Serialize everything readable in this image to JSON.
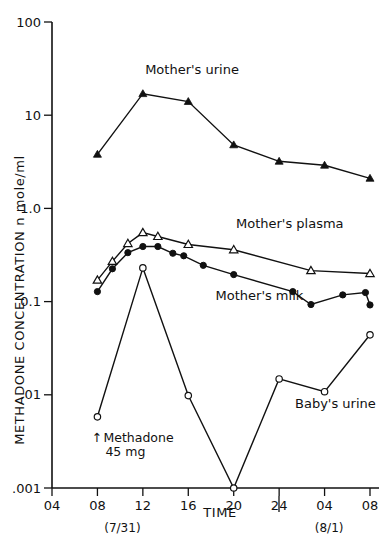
{
  "chart_data": {
    "type": "line",
    "title": "",
    "xlabel": "TIME",
    "ylabel": "METHADONE CONCENTRATION  n mole/ml",
    "y_scale": "log",
    "ylim": [
      0.001,
      100
    ],
    "y_tick_labels": [
      "100",
      "10",
      "1.0",
      "0.1",
      ".01",
      ".001"
    ],
    "y_tick_values": [
      100,
      10,
      1.0,
      0.1,
      0.01,
      0.001
    ],
    "x_tick_labels": [
      "04",
      "08",
      "12",
      "16",
      "20",
      "24",
      "04",
      "08"
    ],
    "x_positions": [
      0,
      1,
      2,
      3,
      4,
      5,
      6,
      7
    ],
    "grid": false,
    "legend_position": "inline-annotations",
    "date_markers": [
      {
        "label": "(7/31)",
        "x": 1.55
      },
      {
        "label": "(8/1)",
        "x": 6.1
      }
    ],
    "day_divider_x": 5.0,
    "annotations": [
      {
        "name": "dose-annotation",
        "line1": "Methadone",
        "line2": "45 mg",
        "arrow": "↑",
        "x": 1.0
      }
    ],
    "series": [
      {
        "name": "Mother's urine",
        "marker": "filled-triangle",
        "label_x": 2.05,
        "label_y": 28,
        "x": [
          1,
          2,
          3,
          4,
          5,
          6,
          7
        ],
        "values": [
          3.8,
          17,
          14,
          4.8,
          3.2,
          2.9,
          2.1
        ]
      },
      {
        "name": "Mother's plasma",
        "marker": "open-triangle",
        "label_x": 4.05,
        "label_y": 0.62,
        "x": [
          1,
          1.33,
          1.67,
          2,
          2.33,
          3,
          4,
          5.7,
          7
        ],
        "values": [
          0.17,
          0.27,
          0.42,
          0.55,
          0.5,
          0.41,
          0.36,
          0.215,
          0.2
        ]
      },
      {
        "name": "Mother's milk",
        "marker": "filled-circle",
        "label_x": 3.6,
        "label_y": 0.105,
        "x": [
          1,
          1.33,
          1.67,
          2,
          2.33,
          2.66,
          2.9,
          3.33,
          4,
          5.3,
          5.7,
          6.4,
          6.9,
          7
        ],
        "values": [
          0.128,
          0.225,
          0.335,
          0.39,
          0.39,
          0.33,
          0.31,
          0.245,
          0.195,
          0.128,
          0.093,
          0.118,
          0.125,
          0.092
        ]
      },
      {
        "name": "Baby's urine",
        "marker": "open-circle",
        "label_x": 5.35,
        "label_y": 0.0072,
        "x": [
          1,
          2,
          3,
          4,
          5,
          6,
          7
        ],
        "values": [
          0.0058,
          0.23,
          0.0098,
          0.001,
          0.0148,
          0.0108,
          0.044
        ]
      }
    ]
  },
  "axes": {
    "y_title": "METHADONE  CONCENTRATION   n mole/ml",
    "x_title": "TIME"
  }
}
